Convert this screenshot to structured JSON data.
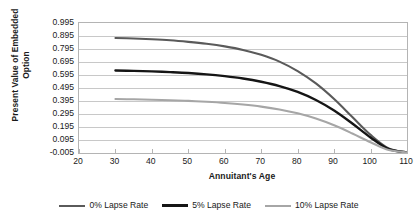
{
  "chart_data": {
    "type": "line",
    "title": "",
    "xlabel": "Annuitant's Age",
    "ylabel_line1": "Present Value of Embedded",
    "ylabel_line2": "Option",
    "xlim": [
      20,
      110
    ],
    "ylim": [
      -0.005,
      0.995
    ],
    "xticks": [
      20,
      30,
      40,
      50,
      60,
      70,
      80,
      90,
      100,
      110
    ],
    "xtick_labels": [
      "20",
      "30",
      "40",
      "50",
      "60",
      "70",
      "80",
      "90",
      "100",
      "110"
    ],
    "yticks": [
      -0.005,
      0.095,
      0.195,
      0.295,
      0.395,
      0.495,
      0.595,
      0.695,
      0.795,
      0.895,
      0.995
    ],
    "ytick_labels": [
      "-0.005",
      "0.095",
      "0.195",
      "0.295",
      "0.395",
      "0.495",
      "0.595",
      "0.695",
      "0.795",
      "0.895",
      "0.995"
    ],
    "grid": true,
    "grid_color": "#c8c8c8",
    "frame_color": "#b4b4b4",
    "legend_position": "bottom",
    "x": [
      30,
      35,
      40,
      45,
      50,
      55,
      60,
      65,
      70,
      75,
      80,
      85,
      90,
      95,
      100,
      105,
      110
    ],
    "series": [
      {
        "name": "0% Lapse Rate",
        "color": "#5a5a5a",
        "width": 2.1,
        "values": [
          0.88,
          0.876,
          0.87,
          0.862,
          0.85,
          0.835,
          0.815,
          0.788,
          0.75,
          0.698,
          0.625,
          0.53,
          0.41,
          0.272,
          0.135,
          0.03,
          0.0
        ]
      },
      {
        "name": "5% Lapse Rate",
        "color": "#151515",
        "width": 2.4,
        "values": [
          0.63,
          0.627,
          0.623,
          0.617,
          0.61,
          0.6,
          0.586,
          0.568,
          0.543,
          0.51,
          0.465,
          0.403,
          0.322,
          0.222,
          0.115,
          0.025,
          0.0
        ]
      },
      {
        "name": "10% Lapse Rate",
        "color": "#a6a6a6",
        "width": 2.1,
        "values": [
          0.41,
          0.408,
          0.405,
          0.401,
          0.396,
          0.389,
          0.38,
          0.368,
          0.352,
          0.33,
          0.3,
          0.26,
          0.208,
          0.145,
          0.078,
          0.018,
          0.0
        ]
      }
    ]
  },
  "legend": {
    "items": [
      {
        "label": "0% Lapse Rate",
        "color": "#5a5a5a",
        "width": "2px"
      },
      {
        "label": "5% Lapse Rate",
        "color": "#151515",
        "width": "3px"
      },
      {
        "label": "10% Lapse Rate",
        "color": "#a6a6a6",
        "width": "2px"
      }
    ]
  }
}
